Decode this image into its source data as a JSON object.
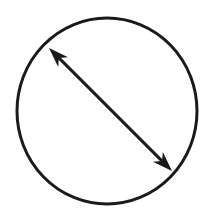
{
  "diagram": {
    "type": "circle-with-diameter-arrow",
    "background": "#ffffff",
    "stroke_color": "#1a1a1a",
    "circle": {
      "cx": 107,
      "cy": 111,
      "rx": 90,
      "ry": 93,
      "stroke_width": 3
    },
    "arrow": {
      "start": {
        "x": 49,
        "y": 48
      },
      "end": {
        "x": 172,
        "y": 171
      },
      "stroke_width": 3,
      "heads": "both",
      "head_style": "notched"
    }
  }
}
